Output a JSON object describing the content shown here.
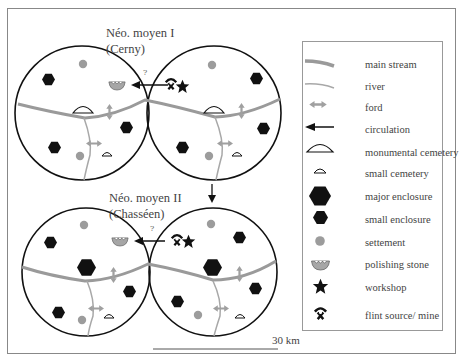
{
  "colors": {
    "stream": "#9a9a9a",
    "river": "#a8a8a8",
    "ford": "#a0a0a0",
    "black": "#111111",
    "settlement": "#9c9c9c",
    "polishing_stone": "#a6a6a6",
    "frame": "#888888"
  },
  "periods": [
    {
      "title_line1": "Néo. moyen I",
      "title_line2": "(Cerny)"
    },
    {
      "title_line1": "Néo. moyen II",
      "title_line2": "(Chasséen)"
    }
  ],
  "question_marks": [
    "?",
    "?"
  ],
  "legend": {
    "items": [
      {
        "icon": "main-stream-icon",
        "label": "main stream"
      },
      {
        "icon": "river-icon",
        "label": "river"
      },
      {
        "icon": "ford-icon",
        "label": "ford"
      },
      {
        "icon": "circulation-arrow-icon",
        "label": "circulation"
      },
      {
        "icon": "monumental-cemetery-icon",
        "label": "monumental cemetery"
      },
      {
        "icon": "small-cemetery-icon",
        "label": "small cemetery"
      },
      {
        "icon": "major-enclosure-icon",
        "label": "major enclosure"
      },
      {
        "icon": "small-enclosure-icon",
        "label": "small enclosure"
      },
      {
        "icon": "settlement-icon",
        "label": "settement"
      },
      {
        "icon": "polishing-stone-icon",
        "label": "polishing stone"
      },
      {
        "icon": "workshop-star-icon",
        "label": "workshop"
      },
      {
        "icon": "flint-mine-icon",
        "label": "flint source/ mine"
      }
    ]
  },
  "scale": {
    "label": "30 km"
  }
}
